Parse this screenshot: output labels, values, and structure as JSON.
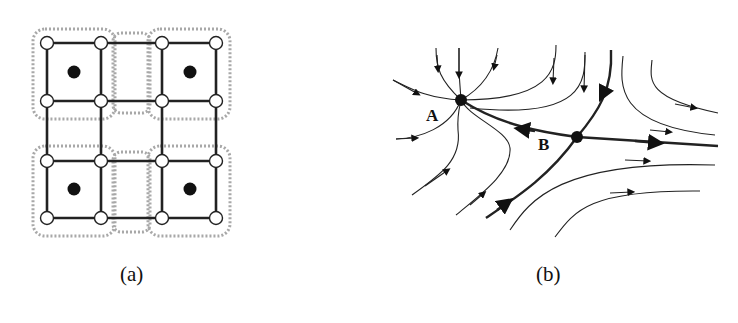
{
  "panels": [
    {
      "id": "a",
      "caption": "(a)",
      "description": "Grid of nodes with four filled-dot cells enclosed by dashed rounded boundaries"
    },
    {
      "id": "b",
      "caption": "(b)",
      "description": "Phase portrait with stable node A and saddle point B"
    }
  ],
  "points": {
    "A": "A",
    "B": "B"
  },
  "colors": {
    "line": "#222222",
    "dashed": "#a8a8a8",
    "node_fill": "#ffffff",
    "dot": "#111111"
  }
}
